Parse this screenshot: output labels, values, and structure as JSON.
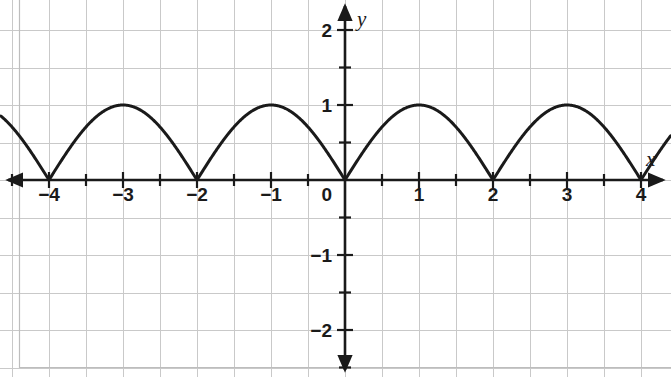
{
  "figure": {
    "background_color": "#ffffff",
    "grid_color": "#c9c9c9",
    "grid_minor_color": "#e2e2e2",
    "axis_color": "#1a1a1a",
    "curve_color": "#1a1a1a",
    "frame_color": "#bdbdbd"
  },
  "chart_data": {
    "type": "line",
    "title": "",
    "subtitle": "",
    "xlabel": "x",
    "ylabel": "y",
    "function_label": "|sin(pi*x/2)|",
    "grid": true,
    "legend": "none",
    "xlim": [
      -4.65,
      4.4
    ],
    "ylim": [
      -2.6,
      2.62
    ],
    "x_major_ticks": [
      -4,
      -3,
      -2,
      -1,
      0,
      1,
      2,
      3,
      4
    ],
    "x_tick_labels": [
      "−4",
      "−3",
      "−2",
      "−1",
      "0",
      "1",
      "2",
      "3",
      "4"
    ],
    "x_minor_ticks": [
      -4.5,
      -3.5,
      -2.5,
      -1.5,
      -0.5,
      0.5,
      1.5,
      2.5,
      3.5
    ],
    "y_major_ticks": [
      -2,
      -1,
      0,
      1,
      2
    ],
    "y_tick_labels": [
      "−2",
      "−1",
      "0",
      "1",
      "2"
    ],
    "y_minor_ticks": [
      -2.5,
      -1.5,
      -0.5,
      0.5,
      1.5,
      2.5
    ],
    "period": 2,
    "amplitude": 1,
    "zeros": [
      -4,
      -2,
      0,
      2,
      4
    ],
    "peaks": [
      {
        "x": -3,
        "y": 1
      },
      {
        "x": -1,
        "y": 1
      },
      {
        "x": 1,
        "y": 1
      },
      {
        "x": 3,
        "y": 1
      }
    ],
    "x": [
      -4.65,
      -4.5,
      -4.25,
      -4,
      -3.75,
      -3.5,
      -3.25,
      -3,
      -2.75,
      -2.5,
      -2.25,
      -2,
      -1.75,
      -1.5,
      -1.25,
      -1,
      -0.75,
      -0.5,
      -0.25,
      0,
      0.25,
      0.5,
      0.75,
      1,
      1.25,
      1.5,
      1.75,
      2,
      2.25,
      2.5,
      2.75,
      3,
      3.25,
      3.5,
      3.75,
      4,
      4.25,
      4.4
    ],
    "y": [
      0.924,
      0.707,
      0.383,
      0,
      0.383,
      0.707,
      0.924,
      1,
      0.924,
      0.707,
      0.383,
      0,
      0.383,
      0.707,
      0.924,
      1,
      0.924,
      0.707,
      0.383,
      0,
      0.383,
      0.707,
      0.924,
      1,
      0.924,
      0.707,
      0.383,
      0,
      0.383,
      0.707,
      0.924,
      1,
      0.924,
      0.707,
      0.383,
      0,
      0.383,
      0.588
    ]
  },
  "axes": {
    "x_axis_name": "x",
    "y_axis_name": "y",
    "origin_label": "0"
  },
  "x_labels": [
    {
      "text": "−4",
      "value": -4
    },
    {
      "text": "−3",
      "value": -3
    },
    {
      "text": "−2",
      "value": -2
    },
    {
      "text": "−1",
      "value": -1
    },
    {
      "text": "1",
      "value": 1
    },
    {
      "text": "2",
      "value": 2
    },
    {
      "text": "3",
      "value": 3
    },
    {
      "text": "4",
      "value": 4
    }
  ],
  "y_labels": [
    {
      "text": "2",
      "value": 2
    },
    {
      "text": "1",
      "value": 1
    },
    {
      "text": "−1",
      "value": -1
    },
    {
      "text": "−2",
      "value": -2
    }
  ]
}
